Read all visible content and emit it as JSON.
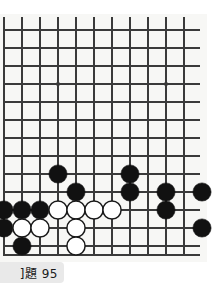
{
  "figure": {
    "kind": "go-board-diagram",
    "caption": "]題 95",
    "colors": {
      "paper": "#f7f7f5",
      "line": "#3a3a3a",
      "black_stone": "#111111",
      "white_stone": "#ffffff",
      "white_stone_outline": "#1a1a1a",
      "caption_background": "#e9e9e9",
      "caption_text": "#1a1a1a"
    }
  },
  "board": {
    "label": "Go board (cropped lower-left portion)",
    "columns": 11,
    "rows": 13,
    "origin_x": 4,
    "origin_y": 30,
    "spacing": 18,
    "bottom_edge_y": 255,
    "star_points": [
      {
        "col": 3,
        "row": 3
      },
      {
        "col": 9,
        "row": 3
      }
    ],
    "stones": [
      {
        "col": 3,
        "row": 8,
        "color": "black"
      },
      {
        "col": 7,
        "row": 8,
        "color": "black"
      },
      {
        "col": 4,
        "row": 9,
        "color": "black"
      },
      {
        "col": 7,
        "row": 9,
        "color": "black"
      },
      {
        "col": 9,
        "row": 9,
        "color": "black"
      },
      {
        "col": 11,
        "row": 9,
        "color": "black"
      },
      {
        "col": 0,
        "row": 10,
        "color": "black"
      },
      {
        "col": 1,
        "row": 10,
        "color": "black"
      },
      {
        "col": 2,
        "row": 10,
        "color": "black"
      },
      {
        "col": 3,
        "row": 10,
        "color": "white"
      },
      {
        "col": 4,
        "row": 10,
        "color": "white"
      },
      {
        "col": 5,
        "row": 10,
        "color": "white"
      },
      {
        "col": 6,
        "row": 10,
        "color": "white"
      },
      {
        "col": 9,
        "row": 10,
        "color": "black"
      },
      {
        "col": 0,
        "row": 11,
        "color": "black"
      },
      {
        "col": 1,
        "row": 11,
        "color": "white"
      },
      {
        "col": 2,
        "row": 11,
        "color": "white"
      },
      {
        "col": 4,
        "row": 11,
        "color": "white"
      },
      {
        "col": 11,
        "row": 11,
        "color": "black"
      },
      {
        "col": 1,
        "row": 12,
        "color": "black"
      },
      {
        "col": 4,
        "row": 12,
        "color": "white"
      }
    ]
  },
  "caption": {
    "text": "]題 95",
    "problem_number": "95"
  }
}
